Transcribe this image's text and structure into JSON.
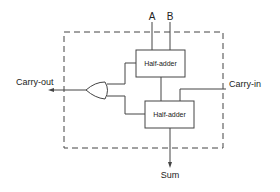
{
  "diagram": {
    "inputs": {
      "a": "A",
      "b": "B",
      "carry_in": "Carry-in"
    },
    "outputs": {
      "carry_out": "Carry-out",
      "sum": "Sum"
    },
    "blocks": {
      "half_adder_top": "Half-adder",
      "half_adder_bottom": "Half-adder"
    },
    "gate": "OR",
    "colors": {
      "line": "#444444",
      "text": "#222222",
      "background": "#ffffff"
    }
  }
}
